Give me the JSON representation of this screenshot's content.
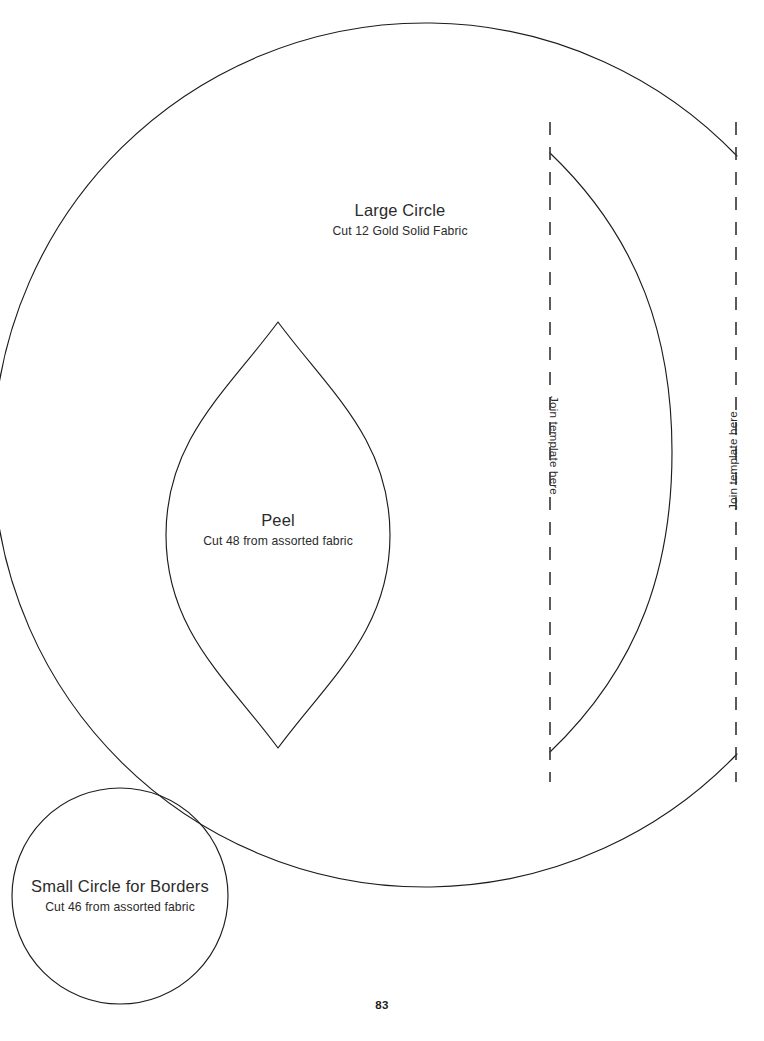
{
  "page": {
    "number": "83",
    "background_color": "#ffffff",
    "ink_color": "#1c1c1c",
    "text_color": "#2b2b2b",
    "width": 764,
    "height": 1041
  },
  "templates": [
    {
      "id": "large-circle",
      "title": "Large Circle",
      "instruction": "Cut 12 Gold Solid Fabric",
      "shape": "circle-arc-with-join"
    },
    {
      "id": "peel",
      "title": "Peel",
      "instruction": "Cut 48 from assorted fabric",
      "shape": "vesica-lens"
    },
    {
      "id": "small-circle",
      "title": "Small Circle for Borders",
      "instruction": "Cut 46 from assorted fabric",
      "shape": "circle"
    }
  ],
  "join_markers": [
    {
      "id": "join-left",
      "label": "Join template here",
      "orientation": "rotate-90"
    },
    {
      "id": "join-right",
      "label": "Join template here",
      "orientation": "rotate-minus-90"
    }
  ]
}
